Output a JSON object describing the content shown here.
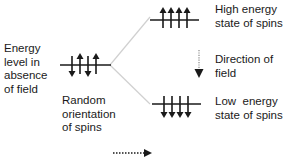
{
  "diagram": {
    "left_label": [
      "Energy",
      "level in",
      "absence",
      "of field"
    ],
    "center_label": [
      "Random",
      "orientation",
      "of spins"
    ],
    "high_label": [
      "High energy",
      "state of spins"
    ],
    "field_label": [
      "Direction of",
      "field"
    ],
    "low_label": [
      "Low  energy",
      "state of spins"
    ],
    "levels": {
      "center": {
        "spins": [
          "down",
          "up",
          "down",
          "up"
        ]
      },
      "high": {
        "spins": [
          "up",
          "up",
          "up",
          "up"
        ]
      },
      "low": {
        "spins": [
          "down",
          "down",
          "down",
          "down"
        ]
      }
    },
    "colors": {
      "ink": "#1a1a1a",
      "connector": "#d0d0d0",
      "field_arrow_dots": "#9a9a9a"
    }
  }
}
